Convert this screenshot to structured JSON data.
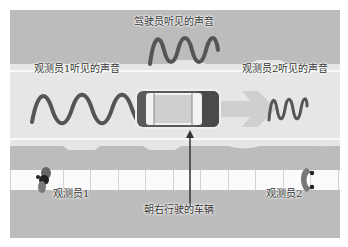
{
  "diagram": {
    "topic": "Doppler effect",
    "labels": {
      "driver_sound": "驾驶员听见的声音",
      "observer1_sound": "观测员1听见的声音",
      "observer2_sound": "观测员2听见的声音",
      "observer1": "观测员1",
      "observer2": "观测员2",
      "vehicle": "朝右行驶的车辆"
    },
    "waves": {
      "driver": {
        "cycles": 4,
        "wavelength": "medium"
      },
      "observer1": {
        "cycles": 4,
        "wavelength": "long"
      },
      "observer2": {
        "cycles": 5,
        "wavelength": "short"
      }
    },
    "vehicle_direction": "right",
    "colors": {
      "background": "#bcbcbc",
      "road": "#e6e6e6",
      "wave": "#555555",
      "arrow": "#cfcfcf",
      "car_body": "#5a5a5a",
      "car_glass": "#d0d0d0",
      "sidewalk": "#fbfbfb"
    }
  }
}
